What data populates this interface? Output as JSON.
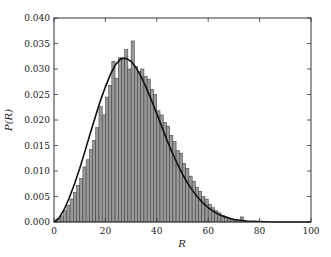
{
  "chart_data": {
    "type": "bar",
    "subtype": "histogram_with_fit_line",
    "title": "",
    "xlabel": "R",
    "ylabel": "P(R)",
    "xlim": [
      0,
      100
    ],
    "ylim": [
      0,
      0.04
    ],
    "grid": false,
    "legend": null,
    "x_ticks": [
      0,
      20,
      40,
      60,
      80,
      100
    ],
    "x_tick_labels": [
      "0",
      "20",
      "40",
      "60",
      "80",
      "100"
    ],
    "y_ticks": [
      0.0,
      0.005,
      0.01,
      0.015,
      0.02,
      0.025,
      0.03,
      0.035,
      0.04
    ],
    "y_tick_labels": [
      "0.000",
      "0.005",
      "0.010",
      "0.015",
      "0.020",
      "0.025",
      "0.030",
      "0.035",
      "0.040"
    ],
    "bin_width": 1.25,
    "bar_color": "#999999",
    "bar_edge_color": "#333333",
    "line_color": "#111111",
    "histogram": {
      "bin_starts": [
        0,
        1.25,
        2.5,
        3.75,
        5,
        6.25,
        7.5,
        8.75,
        10,
        11.25,
        12.5,
        13.75,
        15,
        16.25,
        17.5,
        18.75,
        20,
        21.25,
        22.5,
        23.75,
        25,
        26.25,
        27.5,
        28.75,
        30,
        31.25,
        32.5,
        33.75,
        35,
        36.25,
        37.5,
        38.75,
        40,
        41.25,
        42.5,
        43.75,
        45,
        46.25,
        47.5,
        48.75,
        50,
        51.25,
        52.5,
        53.75,
        55,
        56.25,
        57.5,
        58.75,
        60,
        61.25,
        62.5,
        63.75,
        65,
        66.25,
        67.5,
        68.75,
        70,
        71.25,
        72.5,
        73.75,
        75,
        76.25,
        77.5,
        78.75
      ],
      "values": [
        0.0002,
        0.0006,
        0.0012,
        0.0022,
        0.0033,
        0.0045,
        0.0058,
        0.0072,
        0.0085,
        0.0108,
        0.0122,
        0.0142,
        0.016,
        0.0185,
        0.0226,
        0.021,
        0.0245,
        0.0268,
        0.0315,
        0.0282,
        0.0322,
        0.0322,
        0.0338,
        0.03,
        0.0355,
        0.0305,
        0.0295,
        0.03,
        0.0285,
        0.028,
        0.026,
        0.025,
        0.0218,
        0.021,
        0.0195,
        0.0188,
        0.017,
        0.0158,
        0.014,
        0.0135,
        0.0115,
        0.0105,
        0.009,
        0.008,
        0.0068,
        0.006,
        0.005,
        0.0045,
        0.0035,
        0.0028,
        0.0022,
        0.0018,
        0.0013,
        0.001,
        0.0008,
        0.0006,
        0.0004,
        0.0003,
        0.001,
        0.0002,
        0.0001,
        0.0001,
        0.0001,
        0.0
      ]
    },
    "fit_curve": {
      "description": "smooth fitted distribution, peak ~0.032 at R~26",
      "x": [
        0,
        2,
        4,
        6,
        8,
        10,
        12,
        14,
        16,
        18,
        20,
        22,
        24,
        26,
        28,
        30,
        32,
        34,
        36,
        38,
        40,
        42,
        44,
        46,
        48,
        50,
        52,
        54,
        56,
        58,
        60,
        62,
        64,
        66,
        68,
        70,
        75,
        80,
        85,
        90,
        95,
        100
      ],
      "y": [
        0.0,
        0.0008,
        0.0025,
        0.0048,
        0.0075,
        0.0105,
        0.0138,
        0.0172,
        0.0205,
        0.0237,
        0.0265,
        0.029,
        0.0309,
        0.032,
        0.0321,
        0.0315,
        0.0302,
        0.0284,
        0.0262,
        0.0238,
        0.0212,
        0.0186,
        0.016,
        0.0136,
        0.0114,
        0.0094,
        0.0076,
        0.0061,
        0.0048,
        0.0037,
        0.0028,
        0.0021,
        0.0015,
        0.0011,
        0.0008,
        0.0005,
        0.0002,
        0.0001,
        0.0,
        0.0,
        0.0,
        0.0
      ]
    }
  }
}
